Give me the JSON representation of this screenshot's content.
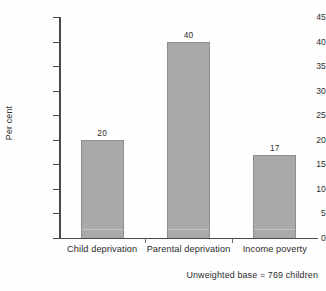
{
  "chart_data": {
    "type": "bar",
    "title": "",
    "subtitle": "",
    "xlabel": "",
    "ylabel": "Per cent",
    "ylim": [
      0,
      45
    ],
    "ytick_step": 5,
    "grid": false,
    "legend": "none",
    "categories": [
      "Child deprivation",
      "Parental deprivation",
      "Income poverty"
    ],
    "values": [
      20,
      40,
      17
    ],
    "value_labels": [
      "20",
      "40",
      "17"
    ],
    "ytick_labels": [
      "0",
      "5",
      "10",
      "15",
      "20",
      "25",
      "30",
      "35",
      "40",
      "45"
    ],
    "annotation": "Unweighted base = 769 children",
    "bar_color": "#a9a9a9",
    "bar_edge_color": "#8e8e8e",
    "axis_color": "#4a4a4a",
    "text_color": "#2b2b2b",
    "background_color": "#fefefe"
  },
  "axis": {
    "y_title": "Per cent"
  },
  "footnote": {
    "text": "Unweighted base = 769 children"
  }
}
